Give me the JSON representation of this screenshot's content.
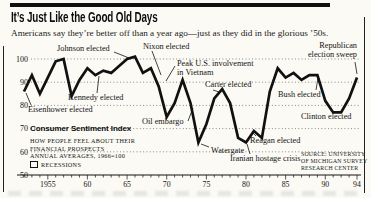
{
  "page": {
    "title": "It’s Just Like the Good Old Days",
    "subtitle": "Americans say they’re better off than a year ago—just as they did in the glorious ’50s."
  },
  "legend": {
    "heading": "Consumer Sentiment Index",
    "line1": "HOW PEOPLE FEEL ABOUT THEIR",
    "line2": "FINANCIAL PROSPECTS",
    "line3": "ANNUAL AVERAGES, 1966=100",
    "recessions_label": "RECESSIONS"
  },
  "source": {
    "line1": "SOURCE: UNIVERSITY",
    "line2": "OF MICHIGAN SURVEY",
    "line3": "RESEARCH CENTER"
  },
  "chart_data": {
    "type": "line",
    "title": "Consumer Sentiment Index",
    "xlabel": "Year",
    "ylabel": "Index (annual averages, 1966=100)",
    "xlim": [
      1952,
      1994
    ],
    "ylim": [
      50,
      105
    ],
    "grid": "dotted horizontal gridlines",
    "gridline_values": [
      100,
      90,
      80,
      70,
      60
    ],
    "x": [
      1952,
      1953,
      1954,
      1955,
      1956,
      1957,
      1958,
      1959,
      1960,
      1961,
      1962,
      1963,
      1964,
      1965,
      1966,
      1967,
      1968,
      1969,
      1970,
      1971,
      1972,
      1973,
      1974,
      1975,
      1976,
      1977,
      1978,
      1979,
      1980,
      1981,
      1982,
      1983,
      1984,
      1985,
      1986,
      1987,
      1988,
      1989,
      1990,
      1991,
      1992,
      1993,
      1994
    ],
    "values": [
      86,
      93,
      85,
      92,
      99,
      100,
      84,
      91,
      96,
      93,
      95,
      94,
      97,
      100,
      101,
      94,
      96,
      88,
      75,
      81,
      91,
      81,
      64,
      72,
      83,
      87,
      81,
      66,
      64,
      69,
      66,
      86,
      96,
      92,
      94,
      91,
      93,
      93,
      82,
      77,
      77,
      83,
      92
    ],
    "y_ticks": [
      {
        "label": "100",
        "value": 100
      },
      {
        "label": "90",
        "value": 90
      },
      {
        "label": "80",
        "value": 80
      },
      {
        "label": "70",
        "value": 70
      },
      {
        "label": "60",
        "value": 60
      },
      {
        "label": "50",
        "value": 50
      }
    ],
    "x_ticks": [
      {
        "label": "1955",
        "year": 1955
      },
      {
        "label": "60",
        "year": 1960
      },
      {
        "label": "65",
        "year": 1965
      },
      {
        "label": "70",
        "year": 1970
      },
      {
        "label": "75",
        "year": 1975
      },
      {
        "label": "80",
        "year": 1980
      },
      {
        "label": "85",
        "year": 1985
      },
      {
        "label": "90",
        "year": 1990
      },
      {
        "label": "94",
        "year": 1994
      }
    ],
    "annotations": [
      {
        "id": "eisenhower-elected",
        "label": "Eisenhower elected",
        "year": 1952,
        "x": 28,
        "y": 106,
        "leader": [
          31,
          105,
          26,
          93
        ]
      },
      {
        "id": "johnson-elected",
        "label": "Johnson elected",
        "year": 1964,
        "x": 57,
        "y": 45,
        "leader": [
          114,
          52,
          129,
          58
        ]
      },
      {
        "id": "kennedy-elected",
        "label": "Kennedy elected",
        "year": 1960,
        "x": 68,
        "y": 94,
        "leader": [
          97,
          93,
          99,
          76
        ]
      },
      {
        "id": "nixon-elected",
        "label": "Nixon elected",
        "year": 1968,
        "x": 143,
        "y": 43,
        "leader": [
          152,
          51,
          161,
          75
        ]
      },
      {
        "id": "peak-us-involvement-vietnam",
        "label": "Peak U.S. involvement\nin Vietnam",
        "year": 1969,
        "x": 177,
        "y": 60,
        "leader": [
          175,
          66,
          166,
          81
        ]
      },
      {
        "id": "oil-embargo",
        "label": "Oil embargo",
        "year": 1973,
        "x": 142,
        "y": 118,
        "leader": [
          188,
          121,
          193,
          108
        ]
      },
      {
        "id": "watergate",
        "label": "Watergate",
        "year": 1974,
        "x": 211,
        "y": 147,
        "leader": [
          209,
          147,
          201,
          144
        ]
      },
      {
        "id": "carter-elected",
        "label": "Carter elected",
        "year": 1976,
        "x": 205,
        "y": 81,
        "leader": [
          213,
          90,
          219,
          92
        ]
      },
      {
        "id": "iranian-hostage-crisis",
        "label": "Iranian hostage crisis",
        "year": 1979,
        "x": 230,
        "y": 155,
        "leader": [
          250,
          154,
          247,
          144
        ]
      },
      {
        "id": "reagan-elected",
        "label": "Reagan elected",
        "year": 1980,
        "x": 250,
        "y": 137,
        "leader": [
          256,
          136,
          253,
          133
        ]
      },
      {
        "id": "bush-elected",
        "label": "Bush elected",
        "year": 1988,
        "x": 278,
        "y": 91,
        "leader": [
          316,
          90,
          318,
          78
        ]
      },
      {
        "id": "clinton-elected",
        "label": "Clinton elected",
        "year": 1992,
        "x": 301,
        "y": 113,
        "leader": null
      },
      {
        "id": "republican-election-sweep",
        "label": "Republican\nelection sweep",
        "year": 1994,
        "x": 357,
        "y": 42,
        "align": "right",
        "leader": [
          355,
          62,
          357,
          74
        ]
      }
    ]
  }
}
